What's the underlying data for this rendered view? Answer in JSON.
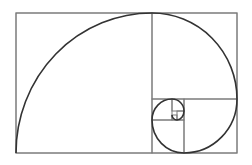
{
  "diagram": {
    "colors": {
      "background": "#ffffff",
      "grid": "#7a7a7a",
      "spiral": "#333333"
    },
    "rects": [
      {
        "name": "outer-rectangle",
        "x": 16,
        "y": 13,
        "w": 221,
        "h": 140
      },
      {
        "name": "square-1",
        "x": 16,
        "y": 13,
        "w": 136,
        "h": 140
      },
      {
        "name": "square-2",
        "x": 152,
        "y": 13,
        "w": 85,
        "h": 86
      },
      {
        "name": "square-3",
        "x": 184,
        "y": 99,
        "w": 53,
        "h": 54
      },
      {
        "name": "square-4",
        "x": 152,
        "y": 120,
        "w": 32,
        "h": 33
      },
      {
        "name": "square-5",
        "x": 152,
        "y": 99,
        "w": 20,
        "h": 21
      },
      {
        "name": "square-6",
        "x": 172,
        "y": 99,
        "w": 12,
        "h": 12
      },
      {
        "name": "square-7",
        "x": 177,
        "y": 111,
        "w": 7,
        "h": 9
      },
      {
        "name": "square-8",
        "x": 172,
        "y": 115,
        "w": 5,
        "h": 5
      }
    ],
    "spiral_path": "M16 153 A136 140 0 0 1 152 13 A85 86 0 0 1 237 99 A53 54 0 0 1 184 153 A32 33 0 0 1 152 120 A20 21 0 0 1 172 99 A12 12 0 0 1 184 111 A7 9 0 0 1 177 120 A5 5 0 0 1 172 115"
  }
}
